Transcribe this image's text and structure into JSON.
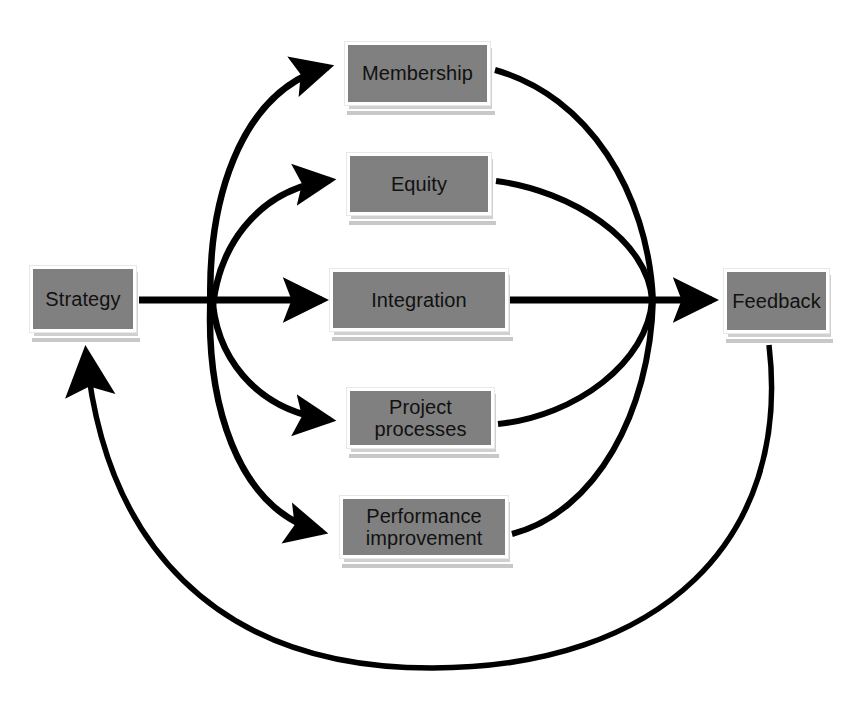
{
  "diagram": {
    "type": "process-flow-diagram",
    "canvas": {
      "width": 857,
      "height": 716
    },
    "colors": {
      "node_fill": "#808080",
      "node_border": "#ffffff",
      "node_shadow": "#d0d0d0",
      "edge": "#000000",
      "label_text": "#111111",
      "background": "#ffffff"
    },
    "nodes": [
      {
        "id": "strategy",
        "label": "Strategy",
        "x": 30,
        "y": 266,
        "w": 106,
        "h": 66,
        "font_size": 20
      },
      {
        "id": "membership",
        "label": "Membership",
        "x": 345,
        "y": 42,
        "w": 145,
        "h": 63,
        "font_size": 20
      },
      {
        "id": "equity",
        "label": "Equity",
        "x": 347,
        "y": 153,
        "w": 144,
        "h": 62,
        "font_size": 20
      },
      {
        "id": "integration",
        "label": "Integration",
        "x": 330,
        "y": 269,
        "w": 178,
        "h": 62,
        "font_size": 20
      },
      {
        "id": "project-processes",
        "label": "Project\nprocesses",
        "x": 347,
        "y": 388,
        "w": 147,
        "h": 60,
        "font_size": 20
      },
      {
        "id": "performance-improvement",
        "label": "Performance\nimprovement",
        "x": 340,
        "y": 496,
        "w": 168,
        "h": 62,
        "font_size": 20
      },
      {
        "id": "feedback",
        "label": "Feedback",
        "x": 724,
        "y": 269,
        "w": 105,
        "h": 64,
        "font_size": 20
      }
    ],
    "edges": [
      {
        "id": "strategy-to-hub",
        "from": "strategy",
        "to": "fan-out-hub",
        "style": "straight",
        "arrow": false
      },
      {
        "id": "hub-to-membership",
        "from": "fan-out-hub",
        "to": "membership",
        "style": "curve",
        "arrow": true
      },
      {
        "id": "hub-to-equity",
        "from": "fan-out-hub",
        "to": "equity",
        "style": "curve",
        "arrow": true
      },
      {
        "id": "hub-to-integration",
        "from": "fan-out-hub",
        "to": "integration",
        "style": "straight",
        "arrow": true
      },
      {
        "id": "hub-to-project-processes",
        "from": "fan-out-hub",
        "to": "project-processes",
        "style": "curve",
        "arrow": true
      },
      {
        "id": "hub-to-performance",
        "from": "fan-out-hub",
        "to": "performance-improvement",
        "style": "curve",
        "arrow": true
      },
      {
        "id": "membership-to-hub-right",
        "from": "membership",
        "to": "fan-in-hub",
        "style": "curve",
        "arrow": false
      },
      {
        "id": "equity-to-hub-right",
        "from": "equity",
        "to": "fan-in-hub",
        "style": "curve",
        "arrow": false
      },
      {
        "id": "project-to-hub-right",
        "from": "project-processes",
        "to": "fan-in-hub",
        "style": "curve",
        "arrow": false
      },
      {
        "id": "performance-to-hub-right",
        "from": "performance-improvement",
        "to": "fan-in-hub",
        "style": "curve",
        "arrow": false
      },
      {
        "id": "hub-right-to-feedback",
        "from": "fan-in-hub",
        "to": "feedback",
        "style": "straight",
        "arrow": true
      },
      {
        "id": "feedback-to-strategy",
        "from": "feedback",
        "to": "strategy",
        "style": "curve",
        "arrow": true
      }
    ],
    "hubs": [
      {
        "id": "fan-out-hub",
        "x": 212,
        "y": 300
      },
      {
        "id": "fan-in-hub",
        "x": 652,
        "y": 300
      }
    ]
  }
}
